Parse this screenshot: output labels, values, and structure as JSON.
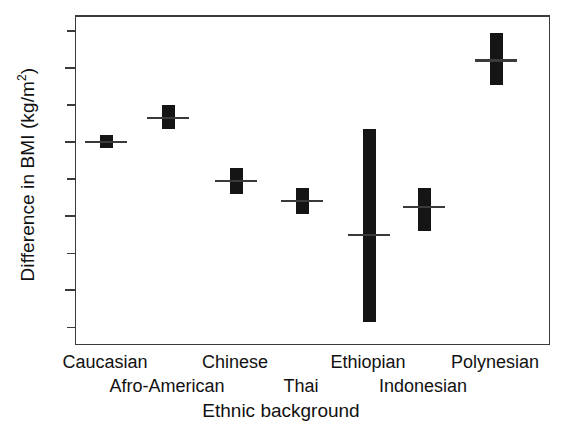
{
  "chart_data": {
    "type": "bar",
    "title": "",
    "subtitle": "",
    "xlabel": "Ethnic background",
    "ylabel": "Difference in BMI (kg/m",
    "ylabel_sup": "2",
    "ylabel_suffix": ")",
    "ylabel_full": "Difference in BMI (kg/m2)",
    "ylim": [
      -11.0,
      6.8
    ],
    "yticks_major": [
      4,
      0,
      -4,
      -8
    ],
    "yticks_major_labels": [
      "4",
      "0",
      "-4",
      "-8"
    ],
    "yticks_minor": [
      6,
      2,
      -2,
      -6,
      -10
    ],
    "grid": false,
    "legend": "none",
    "zero_reference_line": 0,
    "categories": [
      "Caucasian",
      "Afro-American",
      "Chinese",
      "Thai",
      "Ethiopian",
      "Indonesian",
      "Polynesian"
    ],
    "label_rows": [
      {
        "row": 1,
        "labels": [
          "Caucasian",
          "Chinese",
          "Ethiopian",
          "Polynesian"
        ]
      },
      {
        "row": 2,
        "labels": [
          "Afro-American",
          "Thai",
          "Indonesian"
        ]
      }
    ],
    "series": [
      {
        "name": "Difference in BMI",
        "points": [
          {
            "category": "Caucasian",
            "mean": 0.0,
            "low": -0.3,
            "high": 0.4
          },
          {
            "category": "Afro-American",
            "mean": 1.3,
            "low": 0.7,
            "high": 2.0
          },
          {
            "category": "Chinese",
            "mean": -2.1,
            "low": -2.8,
            "high": -1.4
          },
          {
            "category": "Thai",
            "mean": -3.2,
            "low": -3.9,
            "high": -2.5
          },
          {
            "category": "Ethiopian",
            "mean": -5.0,
            "low": -9.7,
            "high": 0.7
          },
          {
            "category": "Indonesian",
            "mean": -3.5,
            "low": -4.8,
            "high": -2.5
          },
          {
            "category": "Polynesian",
            "mean": 4.4,
            "low": 3.1,
            "high": 5.9
          }
        ]
      }
    ],
    "colors": {
      "bar": "#151515",
      "axis": "#3a3a3a",
      "text": "#111111",
      "background": "#ffffff"
    }
  }
}
